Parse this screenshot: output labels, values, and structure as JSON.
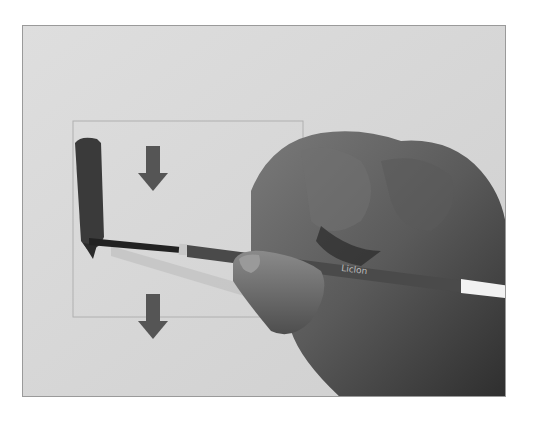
{
  "image": {
    "description": "Grayscale photo of a hand holding a round paintbrush, painting a vertical stroke inside a faint rectangular guide, with two downward arrows indicating stroke direction",
    "brush_label_text": "Liclon",
    "colors": {
      "paper": "#d9d9d9",
      "paint_stroke": "#3a3a3a",
      "arrow": "#555555",
      "hand_dark": "#3c3c3c",
      "hand_mid": "#6a6a6a",
      "brush_handle": "#4a4a4a",
      "brush_end": "#f2f2f2",
      "guide_line": "#b0b0b0"
    },
    "arrows": [
      {
        "direction": "down",
        "x": 152,
        "y": 170
      },
      {
        "direction": "down",
        "x": 152,
        "y": 318
      }
    ]
  }
}
